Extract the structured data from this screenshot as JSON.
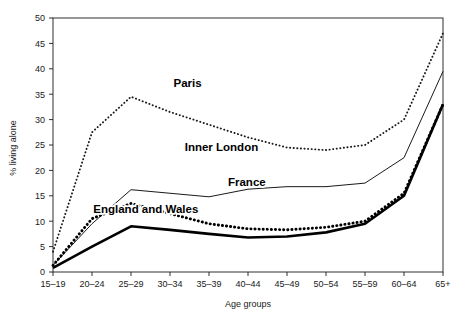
{
  "chart_data": {
    "type": "line",
    "title": "",
    "xlabel": "Age groups",
    "ylabel": "% living alone",
    "categories": [
      "15–19",
      "20–24",
      "25–29",
      "30–34",
      "35–39",
      "40–44",
      "45–49",
      "50–54",
      "55–59",
      "60–64",
      "65+"
    ],
    "ylim": [
      0,
      50
    ],
    "yticks": [
      0,
      5,
      10,
      15,
      20,
      25,
      30,
      35,
      40,
      45,
      50
    ],
    "grid": false,
    "legend_position": "inline-annotations",
    "series": [
      {
        "name": "Paris",
        "style": "fine-dotted",
        "values": [
          4.0,
          27.5,
          34.5,
          31.5,
          29.0,
          26.5,
          24.5,
          24.0,
          25.0,
          30.0,
          47.0
        ]
      },
      {
        "name": "Inner London",
        "style": "thin-solid",
        "values": [
          1.3,
          9.5,
          16.2,
          15.5,
          14.8,
          16.3,
          16.8,
          16.8,
          17.5,
          22.5,
          39.5
        ]
      },
      {
        "name": "France",
        "style": "bold-dotted",
        "values": [
          1.3,
          10.5,
          13.5,
          11.5,
          9.5,
          8.5,
          8.3,
          8.8,
          10.0,
          15.5,
          33.0
        ]
      },
      {
        "name": "England and Wales",
        "style": "bold-solid",
        "values": [
          0.8,
          5.0,
          9.0,
          8.3,
          7.5,
          6.8,
          7.0,
          7.8,
          9.5,
          15.0,
          33.0
        ]
      }
    ],
    "annotations": [
      {
        "text": "Paris",
        "x_frac": 0.345,
        "y_frac": 0.272
      },
      {
        "text": "Inner London",
        "x_frac": 0.432,
        "y_frac": 0.523
      },
      {
        "text": "France",
        "x_frac": 0.497,
        "y_frac": 0.663
      },
      {
        "text": "England and Wales",
        "x_frac": 0.238,
        "y_frac": 0.769
      }
    ]
  },
  "colors": {
    "axis": "#1a1a1a",
    "series_paris": "#1a1a1a",
    "series_inner_london": "#1a1a1a",
    "series_france": "#000000",
    "series_england_wales": "#000000",
    "background": "#ffffff"
  }
}
